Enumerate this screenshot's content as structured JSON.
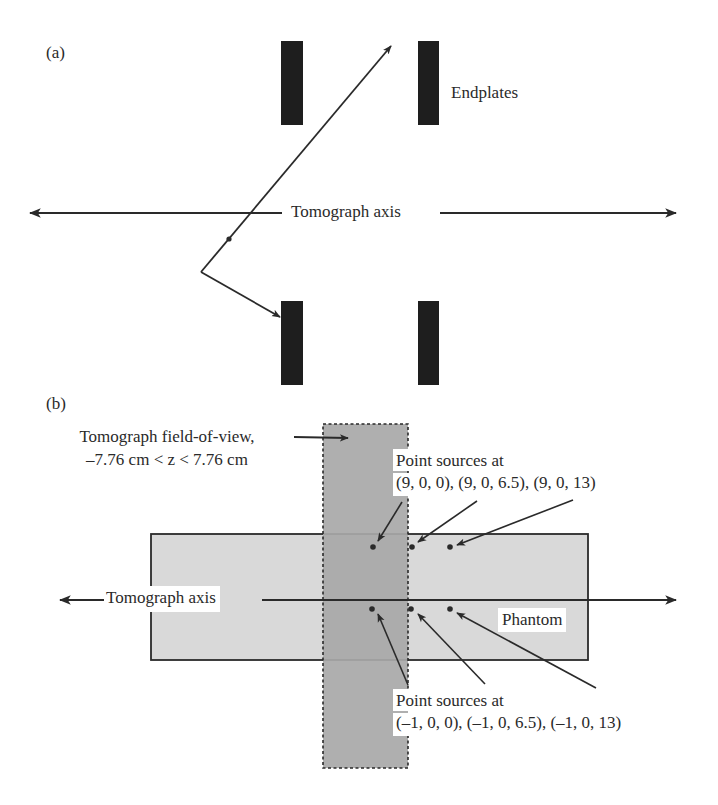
{
  "panel_a": {
    "label": "(a)",
    "endplates_label": "Endplates",
    "axis_label": "Tomograph axis"
  },
  "panel_b": {
    "label": "(b)",
    "fov_label_line1": "Tomograph field-of-view,",
    "fov_label_line2": "–7.76 cm < z < 7.76 cm",
    "top_sources_line1": "Point sources at",
    "top_sources_line2": "(9, 0, 0), (9, 0, 6.5), (9, 0, 13)",
    "axis_label": "Tomograph axis",
    "phantom_label": "Phantom",
    "bottom_sources_line1": "Point sources at",
    "bottom_sources_line2": "(–1, 0, 0), (–1, 0, 6.5), (–1, 0, 13)"
  },
  "colors": {
    "ink": "#2a2a2a",
    "endplate": "#1e1e1e",
    "fov_fill": "#a8a8a8",
    "phantom_fill": "#d9d9d9"
  }
}
